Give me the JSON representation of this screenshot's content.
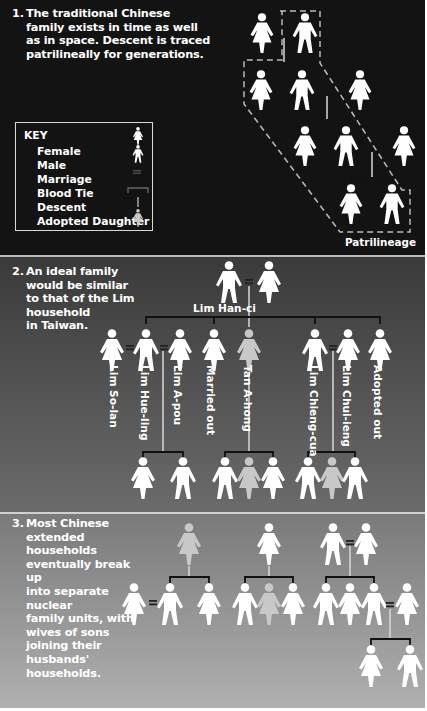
{
  "panels": [
    {
      "number": "1.",
      "caption": "The traditional Chinese\nfamily exists in time as well\nas in space. Descent is traced\npatrilineally for generations.",
      "lineage_label": "Patrilineage",
      "key": {
        "title": "KEY",
        "items": [
          {
            "label": "Female",
            "icon": "female-figure-icon"
          },
          {
            "label": "Male",
            "icon": "male-figure-icon"
          },
          {
            "label": "Marriage",
            "icon": "equals-sign-icon"
          },
          {
            "label": "Blood Tie",
            "icon": "bracket-line-icon"
          },
          {
            "label": "Descent",
            "icon": "vertical-line-icon"
          },
          {
            "label": "Adopted Daughter",
            "icon": "adopted-daughter-icon"
          }
        ]
      }
    },
    {
      "number": "2.",
      "caption": "An ideal family\nwould be similar\nto that of the Lim\nhousehold\nin Taiwan.",
      "head_label": "Lim Han-ci",
      "members": [
        "Lim So-lan",
        "Lim Hue-ling",
        "Lim A-pou",
        "Married out",
        "Tan A-hong",
        "Lim Chieng-cua",
        "Lim Chui-ieng",
        "Adopted out"
      ]
    },
    {
      "number": "3.",
      "caption": "Most Chinese\nextended households\neventually break up\ninto separate nuclear\nfamily units, with\nwives of sons\njoining their\nhusbands'\nhouseholds."
    }
  ],
  "colors": {
    "figure": "#ffffff",
    "adopted": "#c8c8c8",
    "blood_tie": "#111111",
    "descent": "#d8d8d8"
  }
}
